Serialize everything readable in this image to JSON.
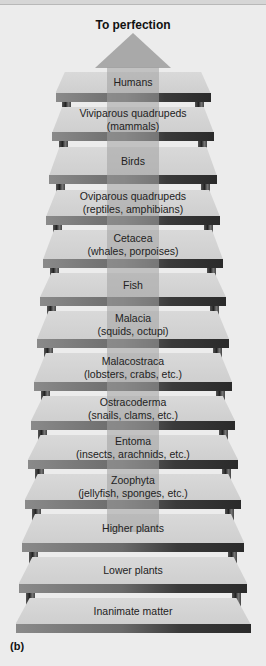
{
  "title": "To perfection",
  "caption": "(b)",
  "colors": {
    "background": "#ececec",
    "step_surface": "#d4d4d4",
    "step_edge_dark": "#2a2a2a",
    "arrow": "#a9a9a9"
  },
  "steps": [
    {
      "line1": "Humans",
      "line2": ""
    },
    {
      "line1": "Viviparous quadrupeds",
      "line2": "(mammals)"
    },
    {
      "line1": "Birds",
      "line2": ""
    },
    {
      "line1": "Oviparous quadrupeds",
      "line2": "(reptiles, amphibians)"
    },
    {
      "line1": "Cetacea",
      "line2": "(whales, porpoises)"
    },
    {
      "line1": "Fish",
      "line2": ""
    },
    {
      "line1": "Malacia",
      "line2": "(squids, octupi)"
    },
    {
      "line1": "Malacostraca",
      "line2": "(lobsters, crabs, etc.)"
    },
    {
      "line1": "Ostracoderma",
      "line2": "(snails, clams, etc.)"
    },
    {
      "line1": "Entoma",
      "line2": "(insects, arachnids, etc.)"
    },
    {
      "line1": "Zoophyta",
      "line2": "(jellyfish, sponges, etc.)"
    },
    {
      "line1": "Higher plants",
      "line2": ""
    },
    {
      "line1": "Lower plants",
      "line2": ""
    },
    {
      "line1": "Inanimate matter",
      "line2": ""
    }
  ]
}
